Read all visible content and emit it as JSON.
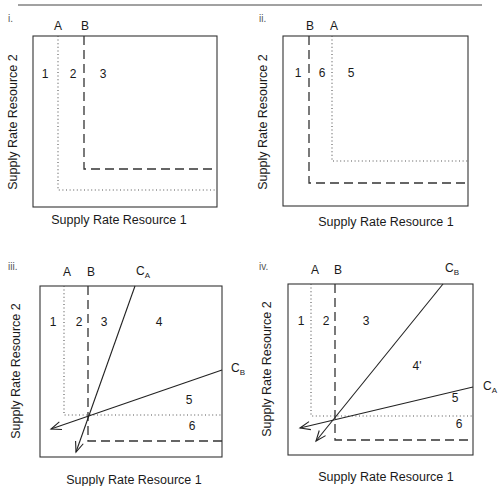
{
  "figure": {
    "top_rule": {
      "x1": 18,
      "x2": 482,
      "y": 5
    },
    "x_axis_label": "Supply Rate Resource 1",
    "y_axis_label": "Supply Rate Resource 2",
    "panels": [
      {
        "id": "i",
        "panel_label": "i.",
        "label_pos": [
          8,
          22
        ],
        "box": {
          "x": 33,
          "y": 36,
          "w": 184,
          "h": 171
        },
        "species_labels": [
          {
            "text": "A",
            "x": 58,
            "y": 30
          },
          {
            "text": "B",
            "x": 85,
            "y": 30
          }
        ],
        "isoclines": [
          {
            "species": "A",
            "style": "dotted",
            "vx": 58,
            "hy": 190
          },
          {
            "species": "B",
            "style": "dashed",
            "vx": 84,
            "hy": 169
          }
        ],
        "consumption_vectors": [],
        "regions": [
          {
            "text": "1",
            "x": 45,
            "y": 78
          },
          {
            "text": "2",
            "x": 73,
            "y": 78
          },
          {
            "text": "3",
            "x": 103,
            "y": 78
          }
        ],
        "x_label_pos": [
          119,
          224
        ],
        "y_label_pos": [
          14,
          122
        ]
      },
      {
        "id": "ii",
        "panel_label": "ii.",
        "label_pos": [
          259,
          22
        ],
        "box": {
          "x": 283,
          "y": 36,
          "w": 185,
          "h": 170
        },
        "species_labels": [
          {
            "text": "B",
            "x": 310,
            "y": 30
          },
          {
            "text": "A",
            "x": 334,
            "y": 30
          }
        ],
        "isoclines": [
          {
            "species": "B",
            "style": "dashed",
            "vx": 309,
            "hy": 183
          },
          {
            "species": "A",
            "style": "dotted",
            "vx": 332,
            "hy": 161
          }
        ],
        "consumption_vectors": [],
        "regions": [
          {
            "text": "1",
            "x": 298,
            "y": 77
          },
          {
            "text": "6",
            "x": 322,
            "y": 77
          },
          {
            "text": "5",
            "x": 351,
            "y": 77
          }
        ],
        "x_label_pos": [
          386,
          226
        ],
        "y_label_pos": [
          264,
          122
        ]
      },
      {
        "id": "iii",
        "panel_label": "iii.",
        "label_pos": [
          8,
          270
        ],
        "box": {
          "x": 40,
          "y": 286,
          "w": 182,
          "h": 171
        },
        "species_labels": [
          {
            "text": "A",
            "x": 67,
            "y": 276
          },
          {
            "text": "B",
            "x": 91,
            "y": 276
          }
        ],
        "isoclines": [
          {
            "species": "A",
            "style": "dotted",
            "vx": 64,
            "hy": 415
          },
          {
            "species": "B",
            "style": "dashed",
            "vx": 88,
            "hy": 441
          }
        ],
        "consumption_vectors": [
          {
            "name": "C",
            "sub": "A",
            "from": [
              135,
              286
            ],
            "to": [
              76,
              452
            ],
            "label_pos": [
              136,
              275
            ]
          },
          {
            "name": "C",
            "sub": "B",
            "from": [
              222,
              370
            ],
            "to": [
              51,
              429
            ],
            "label_pos": [
              231,
              372
            ]
          }
        ],
        "regions": [
          {
            "text": "1",
            "x": 53,
            "y": 326
          },
          {
            "text": "2",
            "x": 79,
            "y": 326
          },
          {
            "text": "3",
            "x": 104,
            "y": 326
          },
          {
            "text": "4",
            "x": 159,
            "y": 326
          },
          {
            "text": "5",
            "x": 189,
            "y": 404
          },
          {
            "text": "6",
            "x": 192,
            "y": 430
          }
        ],
        "x_label_pos": [
          134,
          484
        ],
        "y_label_pos": [
          17,
          371
        ]
      },
      {
        "id": "iv",
        "panel_label": "iv.",
        "label_pos": [
          259,
          270
        ],
        "box": {
          "x": 288,
          "y": 284,
          "w": 185,
          "h": 171
        },
        "species_labels": [
          {
            "text": "A",
            "x": 315,
            "y": 274
          },
          {
            "text": "B",
            "x": 338,
            "y": 274
          }
        ],
        "isoclines": [
          {
            "species": "A",
            "style": "dotted",
            "vx": 311,
            "hy": 416
          },
          {
            "species": "B",
            "style": "dashed",
            "vx": 335,
            "hy": 440
          }
        ],
        "consumption_vectors": [
          {
            "name": "C",
            "sub": "B",
            "from": [
              443,
              284
            ],
            "to": [
              316,
              441
            ],
            "label_pos": [
              445,
              272
            ]
          },
          {
            "name": "C",
            "sub": "A",
            "from": [
              473,
              387
            ],
            "to": [
              300,
              428
            ],
            "label_pos": [
              483,
              390
            ]
          }
        ],
        "regions": [
          {
            "text": "1",
            "x": 301,
            "y": 325
          },
          {
            "text": "2",
            "x": 326,
            "y": 325
          },
          {
            "text": "3",
            "x": 366,
            "y": 325
          },
          {
            "text": "4'",
            "x": 417,
            "y": 370
          },
          {
            "text": "5",
            "x": 455,
            "y": 402
          },
          {
            "text": "6",
            "x": 459,
            "y": 428
          }
        ],
        "x_label_pos": [
          386,
          481
        ],
        "y_label_pos": [
          268,
          369
        ]
      }
    ]
  }
}
